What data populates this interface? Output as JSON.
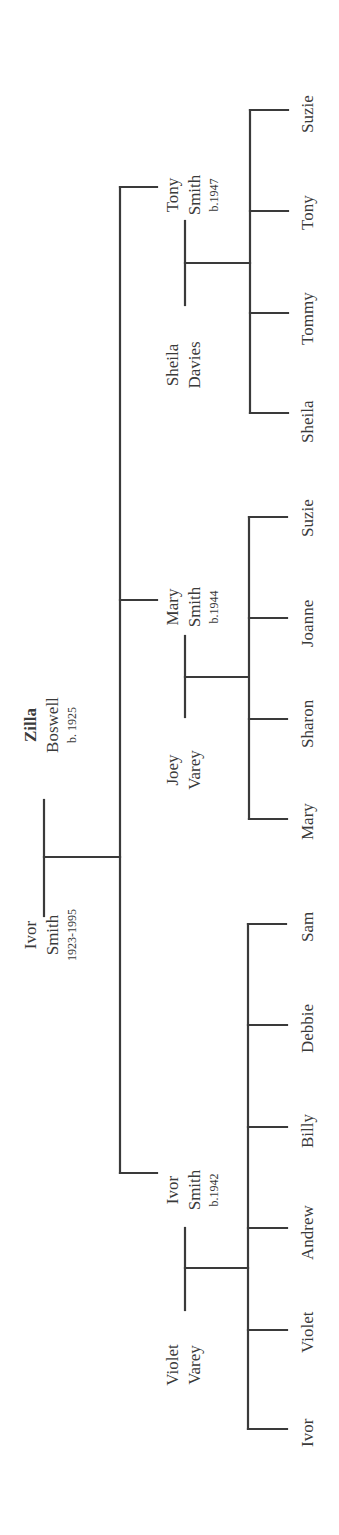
{
  "diagram": {
    "type": "family-tree",
    "orientation": "rotated-90-ccw",
    "line_color": "#3a3a3a",
    "grandparents": {
      "left": {
        "first": "Ivor",
        "last": "Smith",
        "dates": "1923-1995"
      },
      "right": {
        "first": "Zilla",
        "last": "Boswell",
        "dates": "b. 1925",
        "first_bold": true
      }
    },
    "families": [
      {
        "child_of_grandparents": {
          "first": "Ivor",
          "last": "Smith",
          "dates": "b.1942"
        },
        "spouse": {
          "first": "Violet",
          "last": "Varey"
        },
        "children": [
          "Ivor",
          "Violet",
          "Andrew",
          "Billy",
          "Debbie",
          "Sam"
        ]
      },
      {
        "child_of_grandparents": {
          "first": "Mary",
          "last": "Smith",
          "dates": "b.1944"
        },
        "spouse": {
          "first": "Joey",
          "last": "Varey"
        },
        "children": [
          "Mary",
          "Sharon",
          "Joanne",
          "Suzie"
        ]
      },
      {
        "child_of_grandparents": {
          "first": "Tony",
          "last": "Smith",
          "dates": "b.1947"
        },
        "spouse": {
          "first": "Sheila",
          "last": "Davies"
        },
        "children": [
          "Sheila",
          "Tommy",
          "Tony",
          "Suzie"
        ]
      }
    ]
  }
}
